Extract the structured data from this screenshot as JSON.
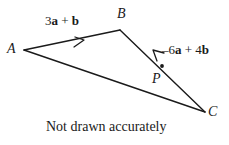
{
  "figure": {
    "type": "vector-triangle-diagram",
    "caption": "Not drawn accurately",
    "stroke_color": "#1a1a1a",
    "background_color": "#ffffff",
    "vertices": [
      {
        "name": "A",
        "label": "A",
        "x": 24,
        "y": 50
      },
      {
        "name": "B",
        "label": "B",
        "x": 120,
        "y": 30
      },
      {
        "name": "C",
        "label": "C",
        "x": 205,
        "y": 112
      },
      {
        "name": "P",
        "label": "P",
        "x": 162,
        "y": 66
      }
    ],
    "segments": [
      {
        "name": "segment-AB",
        "from": "A",
        "to": "B",
        "arrow": true,
        "arrow_at": 0.62
      },
      {
        "name": "segment-AC",
        "from": "A",
        "to": "C",
        "arrow": false
      },
      {
        "name": "segment-BC",
        "from": "B",
        "to": "C",
        "arrow": true,
        "arrow_at": 0.52,
        "arrow_direction": "toward-B"
      }
    ],
    "vector_labels": [
      {
        "name": "vector-label-ab",
        "segment": "segment-AB",
        "parts": [
          {
            "text": "3",
            "bold": false
          },
          {
            "text": "a",
            "bold": true
          },
          {
            "text": " + ",
            "bold": false
          },
          {
            "text": "b",
            "bold": true
          }
        ],
        "plain": "3a + b"
      },
      {
        "name": "vector-label-cb",
        "segment": "segment-BC",
        "parts": [
          {
            "text": "–6",
            "bold": false
          },
          {
            "text": "a",
            "bold": true
          },
          {
            "text": " + 4",
            "bold": false
          },
          {
            "text": "b",
            "bold": true
          }
        ],
        "plain": "–6a + 4b"
      }
    ]
  }
}
